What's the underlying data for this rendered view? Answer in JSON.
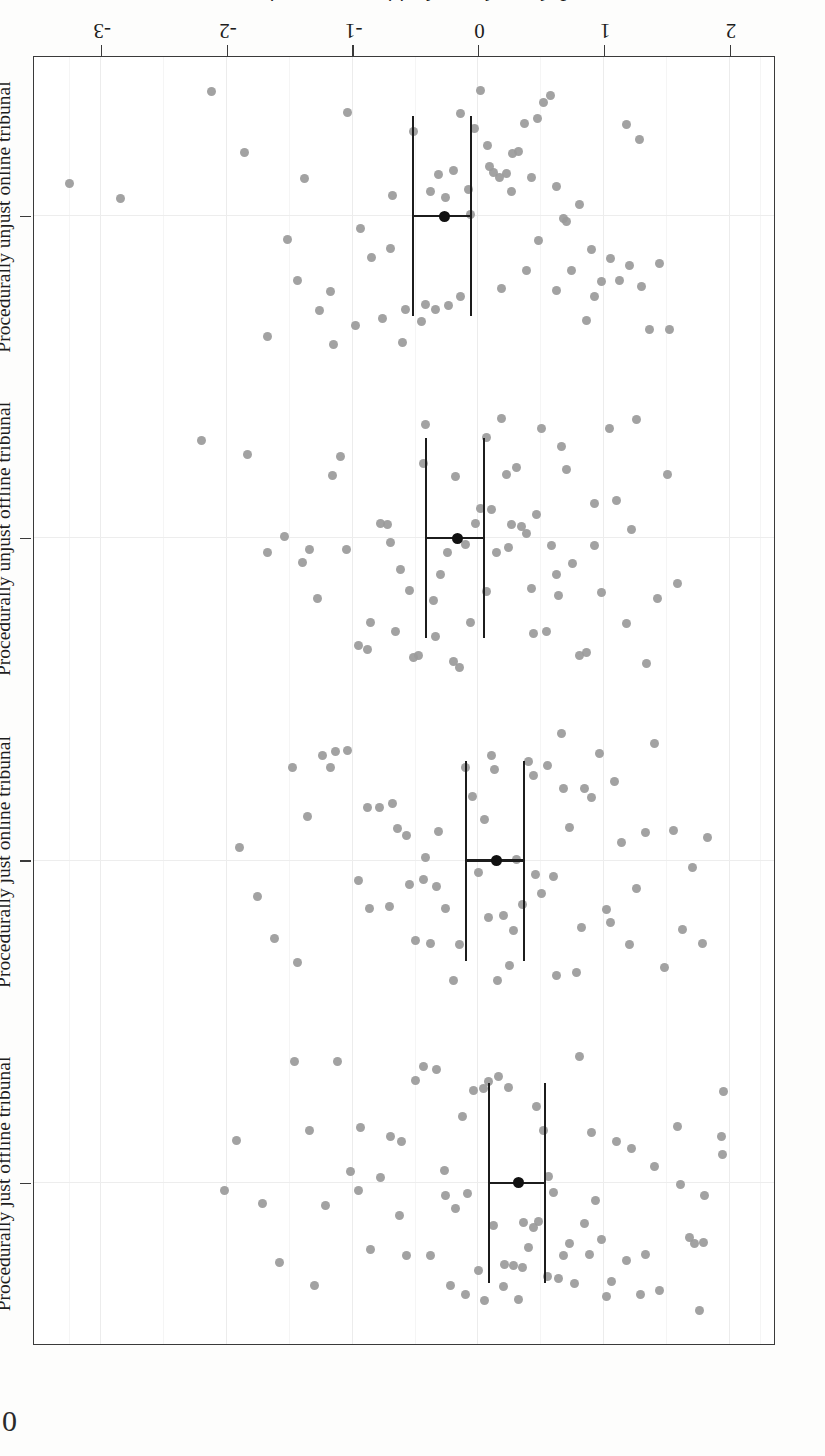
{
  "figure": {
    "orientation_note": "rotated-180",
    "value_axis": {
      "title": "Judge and court legitimacy perceptions",
      "ticks": [
        2,
        1,
        0,
        -1,
        -2,
        -3
      ],
      "tick_labels": [
        "2",
        "1",
        "0",
        "-1",
        "-2",
        "-3"
      ],
      "min": 2.35,
      "max": -3.55
    },
    "corner_artifact": "0",
    "colors": {
      "point": "#9a9a9a",
      "mean": "#111111",
      "error_bar": "#1c1c1c",
      "frame": "#3a3a3a",
      "grid": "#ececec",
      "background": "#ffffff"
    }
  },
  "chart_data": {
    "type": "scatter",
    "title": "",
    "xlabel": "Judge and court legitimacy perceptions",
    "ylabel": "",
    "orientation": "horizontal",
    "xlim": [
      2.35,
      -3.55
    ],
    "grid": true,
    "legend": "none",
    "categories": [
      "Procedurally just offline tribunal",
      "Procedurally just online tribunal",
      "Procedurally unjust offline tribunal",
      "Procedurally unjust online tribunal"
    ],
    "series": [
      {
        "name": "mean",
        "values": [
          0.32,
          0.14,
          -0.17,
          -0.27
        ],
        "ci_low": [
          0.54,
          0.37,
          0.05,
          -0.05
        ],
        "ci_high": [
          0.09,
          -0.09,
          -0.41,
          -0.51
        ]
      }
    ],
    "points": {
      "Procedurally just offline tribunal": [
        1.95,
        1.94,
        1.93,
        1.8,
        1.79,
        1.76,
        1.72,
        1.68,
        1.61,
        1.58,
        1.44,
        1.4,
        1.33,
        1.29,
        1.22,
        1.18,
        1.1,
        1.06,
        1.02,
        0.98,
        0.93,
        0.88,
        0.84,
        0.8,
        0.76,
        0.72,
        0.68,
        0.64,
        0.6,
        0.56,
        0.52,
        0.48,
        0.44,
        0.4,
        0.36,
        0.32,
        0.28,
        0.24,
        0.2,
        0.16,
        0.12,
        0.08,
        0.04,
        0.0,
        -0.04,
        -0.09,
        -0.13,
        -0.18,
        -0.22,
        -0.27,
        -0.33,
        -0.38,
        -0.44,
        -0.5,
        -0.57,
        -0.63,
        -0.7,
        -0.78,
        -0.86,
        -0.94,
        -1.02,
        -1.12,
        -1.22,
        -1.34,
        -1.46,
        -1.58,
        -1.72,
        -1.92,
        -2.02,
        -1.3,
        -0.95,
        -0.61,
        0.35,
        0.46,
        0.21,
        0.05,
        -0.1,
        -0.26,
        0.55,
        0.9
      ],
      "Procedurally just online tribunal": [
        1.82,
        1.78,
        1.7,
        1.62,
        1.55,
        1.48,
        1.4,
        1.33,
        1.26,
        1.2,
        1.14,
        1.08,
        1.02,
        0.96,
        0.9,
        0.84,
        0.78,
        0.72,
        0.66,
        0.6,
        0.55,
        0.5,
        0.45,
        0.4,
        0.35,
        0.3,
        0.25,
        0.2,
        0.15,
        0.1,
        0.05,
        0.0,
        -0.05,
        -0.1,
        -0.15,
        -0.2,
        -0.26,
        -0.32,
        -0.38,
        -0.44,
        -0.5,
        -0.57,
        -0.64,
        -0.71,
        -0.79,
        -0.87,
        -0.95,
        -1.04,
        -1.14,
        -1.24,
        -1.36,
        -1.48,
        -1.62,
        -1.76,
        -1.9,
        -0.88,
        -0.55,
        -0.33,
        0.13,
        0.28,
        0.44,
        0.62,
        0.82,
        1.05,
        -0.68,
        -1.18,
        -1.44,
        0.08,
        -0.42,
        0.68
      ],
      "Procedurally unjust offline tribunal": [
        1.58,
        1.5,
        1.42,
        1.34,
        1.26,
        1.18,
        1.1,
        1.04,
        0.98,
        0.92,
        0.86,
        0.8,
        0.75,
        0.7,
        0.66,
        0.62,
        0.58,
        0.54,
        0.5,
        0.46,
        0.42,
        0.38,
        0.34,
        0.3,
        0.26,
        0.22,
        0.18,
        0.14,
        0.1,
        0.06,
        0.02,
        -0.02,
        -0.06,
        -0.1,
        -0.15,
        -0.2,
        -0.25,
        -0.3,
        -0.36,
        -0.42,
        -0.48,
        -0.55,
        -0.62,
        -0.7,
        -0.78,
        -0.86,
        -0.95,
        -1.05,
        -1.16,
        -1.28,
        -1.4,
        -1.54,
        -1.68,
        -1.84,
        -2.2,
        -0.52,
        0.44,
        0.64,
        0.24,
        -0.18,
        -0.34,
        -0.66,
        -0.88,
        -1.1,
        0.92,
        1.22,
        -0.44,
        0.06,
        -0.72,
        -1.34
      ],
      "Procedurally unjust online tribunal": [
        1.52,
        1.44,
        1.36,
        1.28,
        1.2,
        1.12,
        1.05,
        0.98,
        0.92,
        0.86,
        0.8,
        0.74,
        0.68,
        0.62,
        0.57,
        0.52,
        0.47,
        0.42,
        0.37,
        0.32,
        0.27,
        0.22,
        0.17,
        0.12,
        0.07,
        0.02,
        -0.03,
        -0.08,
        -0.14,
        -0.2,
        -0.26,
        -0.32,
        -0.38,
        -0.45,
        -0.52,
        -0.6,
        -0.68,
        -0.76,
        -0.85,
        -0.94,
        -1.04,
        -1.15,
        -1.26,
        -1.38,
        -1.52,
        -1.68,
        -1.86,
        -2.12,
        -2.85,
        -3.25,
        -0.58,
        -0.24,
        0.09,
        0.38,
        0.62,
        0.9,
        1.18,
        -0.42,
        -0.98,
        -1.44,
        0.48,
        0.18,
        -0.14,
        -0.7,
        1.3,
        -1.18,
        0.7,
        -0.06,
        0.26,
        -0.34
      ]
    }
  }
}
